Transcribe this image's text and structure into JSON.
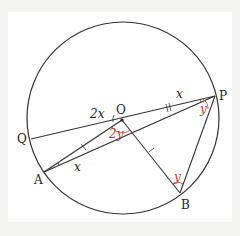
{
  "diagram": {
    "points": {
      "O": {
        "label": "O",
        "x": 122,
        "y": 120
      },
      "P": {
        "label": "P",
        "x": 215,
        "y": 96
      },
      "Q": {
        "label": "Q",
        "x": 31,
        "y": 139
      },
      "A": {
        "label": "A",
        "x": 44,
        "y": 172
      },
      "B": {
        "label": "B",
        "x": 180,
        "y": 193
      }
    },
    "angles": {
      "QOA": "2x",
      "OPQ": "x",
      "OAP": "x",
      "AOB": "2y",
      "OPB": "y",
      "OBP": "y"
    },
    "colors": {
      "line": "#333333",
      "angle_red": "#c0392b",
      "background": "#f4f4f2",
      "panel": "#ffffff"
    }
  }
}
